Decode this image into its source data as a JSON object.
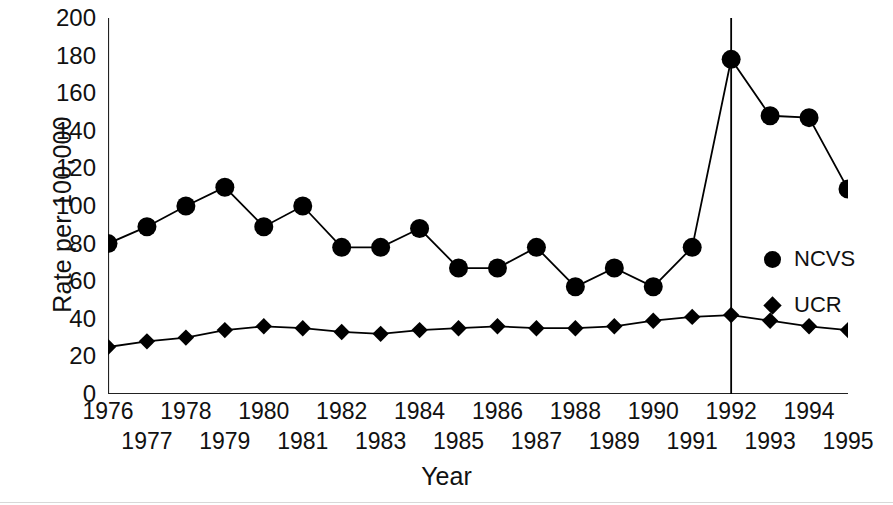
{
  "chart_data": {
    "type": "line",
    "title": "",
    "xlabel": "Year",
    "ylabel": "Rate per 100,000",
    "xlim": [
      1976,
      1995
    ],
    "ylim": [
      0,
      200
    ],
    "ytick_step": 20,
    "yticks": [
      200,
      180,
      160,
      140,
      120,
      100,
      80,
      60,
      40,
      20,
      0
    ],
    "ytick_labels": [
      "200",
      "180",
      "160",
      "140",
      "120",
      "100",
      "80",
      "60",
      "40",
      "20",
      "0"
    ],
    "categories": [
      1976,
      1977,
      1978,
      1979,
      1980,
      1981,
      1982,
      1983,
      1984,
      1985,
      1986,
      1987,
      1988,
      1989,
      1990,
      1991,
      1992,
      1993,
      1994,
      1995
    ],
    "xtick_labels": [
      "1976",
      "1977",
      "1978",
      "1979",
      "1980",
      "1981",
      "1982",
      "1983",
      "1984",
      "1985",
      "1986",
      "1987",
      "1988",
      "1989",
      "1990",
      "1991",
      "1992",
      "1993",
      "1994",
      "1995"
    ],
    "xtick_label_rows": [
      "top",
      "bottom",
      "top",
      "bottom",
      "top",
      "bottom",
      "top",
      "bottom",
      "top",
      "bottom",
      "top",
      "bottom",
      "top",
      "bottom",
      "top",
      "bottom",
      "top",
      "bottom",
      "top",
      "bottom"
    ],
    "grid": false,
    "legend_position": "inside-right",
    "annotations": [
      {
        "name": "vertical-reference-line",
        "x": 1992,
        "style": "solid",
        "color": "#000000"
      }
    ],
    "series": [
      {
        "name": "NCVS",
        "marker": "circle",
        "color": "#000000",
        "values": [
          80,
          89,
          100,
          110,
          89,
          100,
          78,
          78,
          88,
          67,
          67,
          78,
          57,
          67,
          57,
          78,
          178,
          148,
          147,
          109
        ]
      },
      {
        "name": "UCR",
        "marker": "diamond",
        "color": "#000000",
        "values": [
          25,
          28,
          30,
          34,
          36,
          35,
          33,
          32,
          34,
          35,
          36,
          35,
          35,
          36,
          39,
          41,
          42,
          39,
          36,
          34
        ]
      }
    ]
  },
  "legend": {
    "items": [
      {
        "label": "NCVS",
        "marker": "circle"
      },
      {
        "label": "UCR",
        "marker": "diamond"
      }
    ]
  },
  "axes": {
    "y_title": "Rate per 100,000",
    "x_title": "Year"
  }
}
